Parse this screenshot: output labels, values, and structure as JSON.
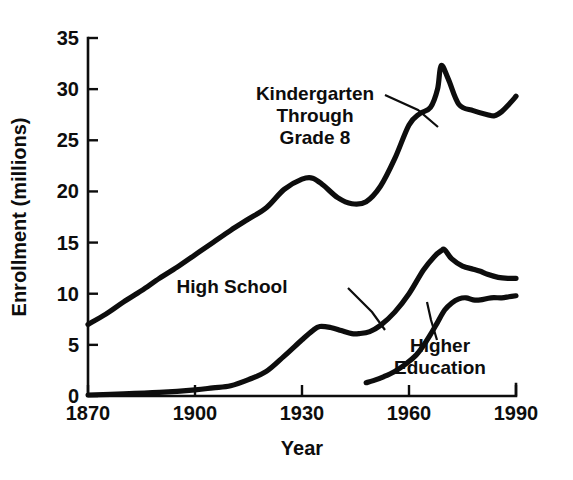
{
  "chart_data": {
    "type": "line",
    "title": "",
    "xlabel": "Year",
    "ylabel": "Enrollment  (millions)",
    "xlim": [
      1870,
      1990
    ],
    "ylim": [
      0,
      35
    ],
    "xticks": [
      1870,
      1900,
      1930,
      1960,
      1990
    ],
    "yticks": [
      0,
      5,
      10,
      15,
      20,
      25,
      30,
      35
    ],
    "xtick_labels": [
      "1870",
      "1900",
      "1930",
      "1960",
      "1990"
    ],
    "ytick_labels": [
      "0",
      "5",
      "10",
      "15",
      "20",
      "25",
      "30",
      "35"
    ],
    "grid": false,
    "legend_position": "inline-annotations",
    "line_color": "#0d0d0d",
    "background_color": "#ffffff",
    "series": [
      {
        "name": "Kindergarten Through Grade 8",
        "label_lines": [
          "Kindergarten",
          "Through",
          "Grade 8"
        ],
        "label_x": 315,
        "label_y": 100,
        "leader": [
          [
            385,
            95
          ],
          [
            418,
            110
          ],
          [
            438,
            127
          ]
        ],
        "x": [
          1870,
          1875,
          1880,
          1885,
          1890,
          1895,
          1900,
          1905,
          1910,
          1915,
          1920,
          1925,
          1930,
          1933,
          1936,
          1940,
          1944,
          1948,
          1952,
          1956,
          1960,
          1963,
          1966,
          1968,
          1969,
          1971,
          1974,
          1978,
          1982,
          1984,
          1986,
          1988,
          1990
        ],
        "y": [
          7.0,
          8.0,
          9.2,
          10.3,
          11.5,
          12.6,
          13.8,
          15.0,
          16.2,
          17.3,
          18.4,
          20.2,
          21.2,
          21.3,
          20.6,
          19.4,
          18.8,
          19.0,
          20.5,
          23.2,
          26.5,
          27.6,
          28.2,
          30.0,
          32.3,
          31.0,
          28.5,
          27.9,
          27.5,
          27.4,
          27.8,
          28.5,
          29.3
        ]
      },
      {
        "name": "High School",
        "label_lines": [
          "High School"
        ],
        "label_x": 232,
        "label_y": 293,
        "leader": [
          [
            348,
            288
          ],
          [
            372,
            312
          ],
          [
            385,
            330
          ]
        ],
        "x": [
          1870,
          1880,
          1890,
          1900,
          1905,
          1910,
          1915,
          1920,
          1925,
          1930,
          1933,
          1935,
          1938,
          1941,
          1944,
          1946,
          1949,
          1952,
          1956,
          1960,
          1964,
          1967,
          1969,
          1970,
          1972,
          1975,
          1978,
          1980,
          1982,
          1985,
          1988,
          1990
        ],
        "y": [
          0.1,
          0.2,
          0.35,
          0.6,
          0.8,
          1.0,
          1.6,
          2.4,
          3.9,
          5.5,
          6.4,
          6.8,
          6.7,
          6.4,
          6.1,
          6.1,
          6.3,
          6.9,
          8.2,
          10.0,
          12.3,
          13.6,
          14.2,
          14.3,
          13.4,
          12.7,
          12.4,
          12.2,
          11.9,
          11.6,
          11.5,
          11.5
        ]
      },
      {
        "name": "Higher Education",
        "label_lines": [
          "Higher",
          "Education"
        ],
        "label_x": 440,
        "label_y": 352,
        "leader": [
          [
            437,
            340
          ],
          [
            431,
            320
          ],
          [
            427,
            302
          ]
        ],
        "x": [
          1948,
          1950,
          1953,
          1956,
          1959,
          1962,
          1964,
          1966,
          1968,
          1970,
          1972,
          1974,
          1976,
          1978,
          1980,
          1983,
          1986,
          1988,
          1990
        ],
        "y": [
          1.3,
          1.5,
          1.9,
          2.4,
          3.1,
          4.0,
          4.9,
          6.0,
          7.2,
          8.4,
          9.1,
          9.5,
          9.6,
          9.4,
          9.4,
          9.6,
          9.6,
          9.7,
          9.8
        ]
      }
    ]
  },
  "plot_geometry": {
    "left": 88,
    "right": 516,
    "top": 38,
    "bottom": 396
  }
}
